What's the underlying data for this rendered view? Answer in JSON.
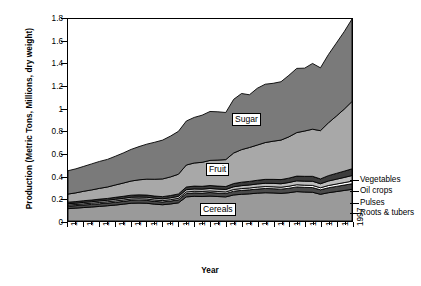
{
  "chart_data": {
    "type": "area",
    "stacked": true,
    "title": "",
    "xlabel": "Year",
    "ylabel": "Production (Metric Tons, Millions, dry weight)",
    "xlim": [
      1961,
      1997
    ],
    "ylim": [
      0,
      1.8
    ],
    "ytick_labels": [
      "0",
      "0.2",
      "0.4",
      "0.6",
      "0.8",
      "1",
      "1.2",
      "1.4",
      "1.6",
      "1.8"
    ],
    "ytick_values": [
      0,
      0.2,
      0.4,
      0.6,
      0.8,
      1.0,
      1.2,
      1.4,
      1.6,
      1.8
    ],
    "xtick_labels": [
      "1961",
      "1963",
      "1965",
      "1967",
      "1969",
      "1971",
      "1973",
      "1975",
      "1977",
      "1979",
      "1981",
      "1983",
      "1985",
      "1987",
      "1989",
      "1991",
      "1993",
      "1995",
      "1997"
    ],
    "grid": false,
    "legend_position": "right-inline-and-inplot",
    "x": [
      1961,
      1962,
      1963,
      1964,
      1965,
      1966,
      1967,
      1968,
      1969,
      1970,
      1971,
      1972,
      1973,
      1974,
      1975,
      1976,
      1977,
      1978,
      1979,
      1980,
      1981,
      1982,
      1983,
      1984,
      1985,
      1986,
      1987,
      1988,
      1989,
      1990,
      1991,
      1992,
      1993,
      1994,
      1995,
      1996,
      1997
    ],
    "series": [
      {
        "name": "Cereals",
        "color": "#9a9a9a",
        "label_in_plot": "Cereals",
        "values": [
          0.11,
          0.115,
          0.12,
          0.125,
          0.13,
          0.136,
          0.142,
          0.15,
          0.158,
          0.16,
          0.158,
          0.15,
          0.145,
          0.152,
          0.162,
          0.215,
          0.22,
          0.218,
          0.222,
          0.218,
          0.215,
          0.232,
          0.238,
          0.242,
          0.248,
          0.252,
          0.25,
          0.246,
          0.252,
          0.262,
          0.258,
          0.256,
          0.238,
          0.252,
          0.262,
          0.272,
          0.282
        ]
      },
      {
        "name": "Roots & tubers",
        "color": "#4a4a4a",
        "values": [
          0.022,
          0.022,
          0.023,
          0.023,
          0.024,
          0.024,
          0.025,
          0.025,
          0.026,
          0.026,
          0.026,
          0.025,
          0.025,
          0.026,
          0.027,
          0.03,
          0.031,
          0.031,
          0.032,
          0.031,
          0.03,
          0.034,
          0.035,
          0.036,
          0.037,
          0.038,
          0.038,
          0.038,
          0.04,
          0.042,
          0.042,
          0.042,
          0.04,
          0.044,
          0.046,
          0.048,
          0.05
        ]
      },
      {
        "name": "Pulses",
        "color": "#ffffff",
        "values": [
          0.01,
          0.01,
          0.01,
          0.011,
          0.011,
          0.011,
          0.012,
          0.012,
          0.012,
          0.012,
          0.012,
          0.012,
          0.012,
          0.012,
          0.013,
          0.014,
          0.014,
          0.014,
          0.014,
          0.014,
          0.014,
          0.015,
          0.016,
          0.016,
          0.017,
          0.017,
          0.017,
          0.017,
          0.018,
          0.019,
          0.019,
          0.019,
          0.018,
          0.02,
          0.021,
          0.022,
          0.023
        ]
      },
      {
        "name": "Oil crops",
        "color": "#bcbcbc",
        "values": [
          0.012,
          0.012,
          0.013,
          0.013,
          0.014,
          0.014,
          0.015,
          0.015,
          0.016,
          0.016,
          0.016,
          0.016,
          0.016,
          0.017,
          0.018,
          0.02,
          0.021,
          0.021,
          0.022,
          0.022,
          0.022,
          0.024,
          0.026,
          0.027,
          0.028,
          0.029,
          0.03,
          0.031,
          0.033,
          0.035,
          0.036,
          0.037,
          0.036,
          0.04,
          0.043,
          0.046,
          0.05
        ]
      },
      {
        "name": "Vegetables",
        "color": "#3c3c3c",
        "values": [
          0.014,
          0.014,
          0.015,
          0.015,
          0.016,
          0.016,
          0.017,
          0.018,
          0.018,
          0.019,
          0.019,
          0.019,
          0.019,
          0.02,
          0.021,
          0.024,
          0.025,
          0.025,
          0.026,
          0.026,
          0.026,
          0.029,
          0.031,
          0.032,
          0.033,
          0.035,
          0.036,
          0.037,
          0.039,
          0.042,
          0.043,
          0.044,
          0.043,
          0.048,
          0.052,
          0.056,
          0.06
        ]
      },
      {
        "name": "Fruit",
        "color": "#a8a8a8",
        "label_in_plot": "Fruit",
        "values": [
          0.072,
          0.078,
          0.084,
          0.09,
          0.096,
          0.102,
          0.11,
          0.118,
          0.126,
          0.134,
          0.142,
          0.15,
          0.158,
          0.166,
          0.176,
          0.196,
          0.206,
          0.214,
          0.224,
          0.232,
          0.24,
          0.272,
          0.29,
          0.302,
          0.314,
          0.328,
          0.34,
          0.352,
          0.368,
          0.388,
          0.404,
          0.42,
          0.43,
          0.47,
          0.51,
          0.552,
          0.6
        ]
      },
      {
        "name": "Sugar",
        "color": "#7a7a7a",
        "label_in_plot": "Sugar",
        "values": [
          0.208,
          0.214,
          0.222,
          0.232,
          0.24,
          0.246,
          0.256,
          0.268,
          0.282,
          0.296,
          0.312,
          0.33,
          0.346,
          0.364,
          0.382,
          0.392,
          0.406,
          0.42,
          0.436,
          0.43,
          0.42,
          0.478,
          0.5,
          0.47,
          0.506,
          0.52,
          0.516,
          0.52,
          0.548,
          0.572,
          0.56,
          0.586,
          0.56,
          0.608,
          0.65,
          0.69,
          0.735
        ]
      }
    ]
  },
  "plot_labels": [
    {
      "name": "sugar",
      "text": "Sugar",
      "x": 232,
      "y": 113
    },
    {
      "name": "fruit",
      "text": "Fruit",
      "x": 206,
      "y": 163
    },
    {
      "name": "cereals",
      "text": "Cereals",
      "x": 200,
      "y": 203
    }
  ],
  "legend": [
    {
      "name": "vegetables",
      "text": "Vegetables",
      "y": 175,
      "anchor_y": 182
    },
    {
      "name": "oil-crops",
      "text": "Oil crops",
      "y": 186,
      "anchor_y": 188
    },
    {
      "name": "pulses",
      "text": "Pulses",
      "y": 198,
      "anchor_y": 196
    },
    {
      "name": "roots-tubers",
      "text": "Roots & tubers",
      "y": 208,
      "anchor_y": 203
    }
  ]
}
